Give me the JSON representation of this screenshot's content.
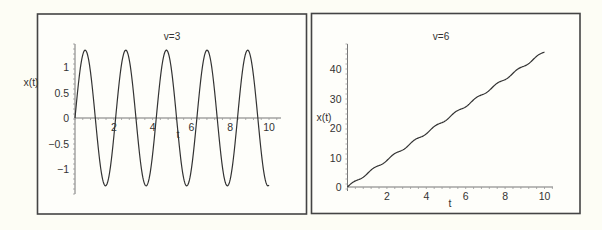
{
  "chart_data": [
    {
      "type": "line",
      "title": "v=3",
      "xlabel": "t",
      "ylabel": "x(t)",
      "xlim": [
        0,
        10
      ],
      "ylim": [
        -1.45,
        1.45
      ],
      "xticks": [
        2,
        4,
        6,
        8,
        10
      ],
      "xtick_labels": [
        "2",
        "4",
        "6",
        "8",
        "10"
      ],
      "yticks": [
        -1,
        -0.5,
        0,
        0.5,
        1
      ],
      "ytick_labels": [
        "−1",
        "−0.5",
        "0",
        "0.5",
        "1"
      ],
      "grid": false,
      "legend": null,
      "function": "x(t) = 1.33 * sin(3t)",
      "series": [
        {
          "name": "x(t)",
          "x": [
            0,
            0.52,
            1.05,
            1.57,
            2.09,
            2.62,
            3.14,
            3.67,
            4.19,
            4.71,
            5.24,
            5.76,
            6.28,
            6.81,
            7.33,
            7.85,
            8.38,
            8.9,
            9.42,
            9.95,
            10
          ],
          "y": [
            0,
            1.33,
            0,
            -1.33,
            0,
            1.33,
            0,
            -1.33,
            0,
            1.33,
            0,
            -1.33,
            0,
            1.33,
            0,
            -1.33,
            0,
            1.33,
            0,
            -1.33,
            0.2
          ]
        }
      ]
    },
    {
      "type": "line",
      "title": "v=6",
      "xlabel": "t",
      "ylabel": "x(t)",
      "xlim": [
        0,
        10
      ],
      "ylim": [
        0,
        48
      ],
      "xticks": [
        2,
        4,
        6,
        8,
        10
      ],
      "xtick_labels": [
        "2",
        "4",
        "6",
        "8",
        "10"
      ],
      "yticks": [
        0,
        10,
        20,
        30,
        40
      ],
      "ytick_labels": [
        "0",
        "10",
        "20",
        "30",
        "40"
      ],
      "grid": false,
      "legend": null,
      "function": "x(t) ≈ 4.6t + small oscillation (period ≈ 1.05)",
      "series": [
        {
          "name": "x(t)",
          "x": [
            0,
            1,
            2,
            3,
            4,
            5,
            6,
            7,
            8,
            9,
            10
          ],
          "y": [
            0,
            4.8,
            9.3,
            13.8,
            18.6,
            23.2,
            27.6,
            32.3,
            37.0,
            41.5,
            46.2
          ]
        }
      ]
    }
  ],
  "panels": [
    {
      "title": "v=3",
      "ylabel": "x(t)",
      "xlabel": "t"
    },
    {
      "title": "v=6",
      "ylabel": "x(t)",
      "xlabel": "t"
    }
  ]
}
